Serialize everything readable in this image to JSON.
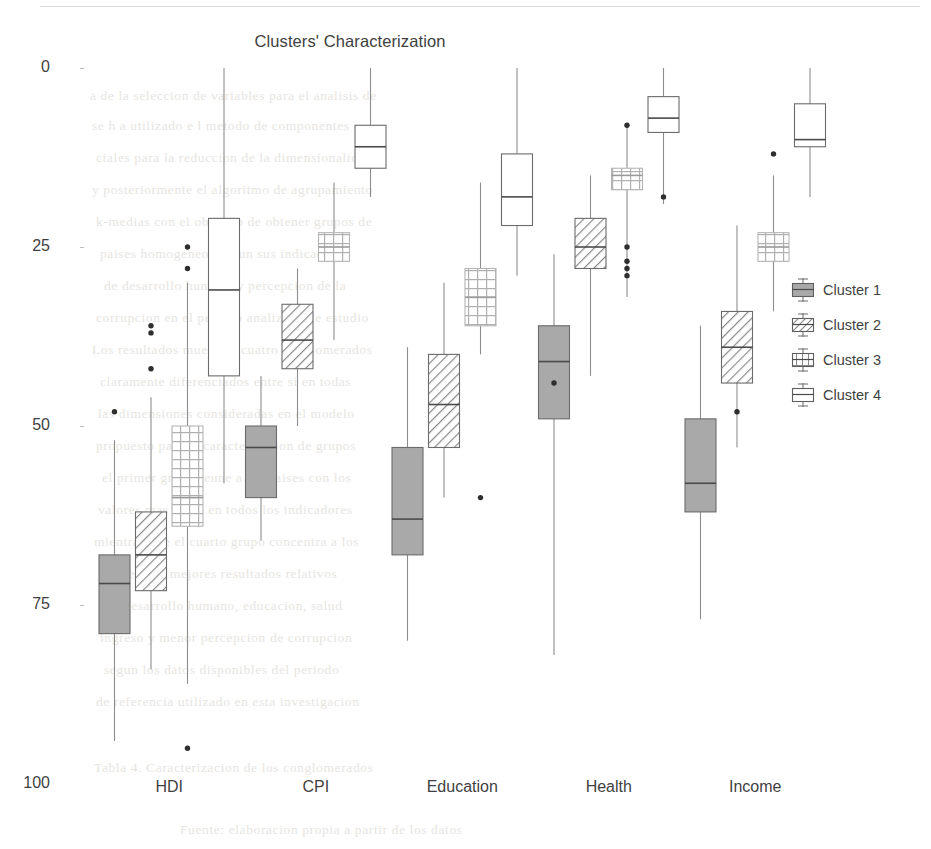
{
  "chart_data": {
    "type": "box",
    "title": "Clusters' Characterization",
    "xlabel": "",
    "ylabel": "",
    "ylim": [
      0,
      100
    ],
    "yticks": [
      0,
      25,
      50,
      75,
      100
    ],
    "grid": false,
    "legend_position": "right",
    "categories": [
      "HDI",
      "CPI",
      "Education",
      "Health",
      "Income"
    ],
    "series": [
      {
        "name": "Cluster 1",
        "fill": "#a6a6a6",
        "pattern": "solid",
        "boxes": [
          {
            "category": "HDI",
            "whisker_low": 6,
            "q1": 21,
            "median": 28,
            "q3": 32,
            "whisker_high": 48,
            "outliers": [
              52
            ]
          },
          {
            "category": "CPI",
            "whisker_low": 34,
            "q1": 40,
            "median": 47,
            "q3": 50,
            "whisker_high": 57,
            "outliers": []
          },
          {
            "category": "Education",
            "whisker_low": 20,
            "q1": 32,
            "median": 37,
            "q3": 47,
            "whisker_high": 61,
            "outliers": []
          },
          {
            "category": "Health",
            "whisker_low": 18,
            "q1": 51,
            "median": 59,
            "q3": 64,
            "whisker_high": 74,
            "outliers": [
              56
            ]
          },
          {
            "category": "Income",
            "whisker_low": 23,
            "q1": 38,
            "median": 42,
            "q3": 51,
            "whisker_high": 64,
            "outliers": []
          }
        ]
      },
      {
        "name": "Cluster 2",
        "fill": "#ffffff",
        "pattern": "diagonal-hatch",
        "boxes": [
          {
            "category": "HDI",
            "whisker_low": 16,
            "q1": 27,
            "median": 32,
            "q3": 38,
            "whisker_high": 54,
            "outliers": [
              58,
              63,
              64
            ]
          },
          {
            "category": "CPI",
            "whisker_low": 50,
            "q1": 58,
            "median": 62,
            "q3": 67,
            "whisker_high": 72,
            "outliers": []
          },
          {
            "category": "Education",
            "whisker_low": 40,
            "q1": 47,
            "median": 53,
            "q3": 60,
            "whisker_high": 70,
            "outliers": []
          },
          {
            "category": "Health",
            "whisker_low": 57,
            "q1": 72,
            "median": 75,
            "q3": 79,
            "whisker_high": 85,
            "outliers": []
          },
          {
            "category": "Income",
            "whisker_low": 47,
            "q1": 56,
            "median": 61,
            "q3": 66,
            "whisker_high": 78,
            "outliers": [
              52
            ]
          }
        ]
      },
      {
        "name": "Cluster 3",
        "fill": "#ffffff",
        "pattern": "cross-hatch",
        "boxes": [
          {
            "category": "HDI",
            "whisker_low": 14,
            "q1": 36,
            "median": 40,
            "q3": 50,
            "whisker_high": 70,
            "outliers": [
              72,
              75,
              5
            ]
          },
          {
            "category": "CPI",
            "whisker_low": 62,
            "q1": 73,
            "median": 75,
            "q3": 77,
            "whisker_high": 84,
            "outliers": []
          },
          {
            "category": "Education",
            "whisker_low": 60,
            "q1": 64,
            "median": 68,
            "q3": 72,
            "whisker_high": 84,
            "outliers": [
              40
            ]
          },
          {
            "category": "Health",
            "whisker_low": 68,
            "q1": 83,
            "median": 85,
            "q3": 86,
            "whisker_high": 92,
            "outliers": [
              75,
              73,
              72,
              71,
              92
            ]
          },
          {
            "category": "Income",
            "whisker_low": 66,
            "q1": 73,
            "median": 75,
            "q3": 77,
            "whisker_high": 85,
            "outliers": [
              88
            ]
          }
        ]
      },
      {
        "name": "Cluster 4",
        "fill": "#ffffff",
        "pattern": "none",
        "boxes": [
          {
            "category": "HDI",
            "whisker_low": 42,
            "q1": 57,
            "median": 69,
            "q3": 79,
            "whisker_high": 100,
            "outliers": []
          },
          {
            "category": "CPI",
            "whisker_low": 82,
            "q1": 86,
            "median": 89,
            "q3": 92,
            "whisker_high": 100,
            "outliers": []
          },
          {
            "category": "Education",
            "whisker_low": 71,
            "q1": 78,
            "median": 82,
            "q3": 88,
            "whisker_high": 100,
            "outliers": []
          },
          {
            "category": "Health",
            "whisker_low": 81,
            "q1": 91,
            "median": 93,
            "q3": 96,
            "whisker_high": 100,
            "outliers": [
              82
            ]
          },
          {
            "category": "Income",
            "whisker_low": 82,
            "q1": 89,
            "median": 90,
            "q3": 95,
            "whisker_high": 100,
            "outliers": []
          }
        ]
      }
    ]
  },
  "axis": {
    "yticks": [
      {
        "label": "100"
      },
      {
        "label": "75"
      },
      {
        "label": "50"
      },
      {
        "label": "25"
      },
      {
        "label": "0"
      }
    ],
    "xticks": [
      {
        "label": "HDI"
      },
      {
        "label": "CPI"
      },
      {
        "label": "Education"
      },
      {
        "label": "Health"
      },
      {
        "label": "Income"
      }
    ]
  },
  "legend": {
    "items": [
      {
        "label": "Cluster 1",
        "pattern": "solid",
        "color": "#a6a6a6"
      },
      {
        "label": "Cluster 2",
        "pattern": "diagonal-hatch",
        "color": "#6e6e6e"
      },
      {
        "label": "Cluster 3",
        "pattern": "cross-hatch",
        "color": "#6e6e6e"
      },
      {
        "label": "Cluster 4",
        "pattern": "none",
        "color": "#6e6e6e"
      }
    ]
  },
  "background_artifacts": [
    {
      "text": "a de la seleccion de variables para el analisis de",
      "x": 90,
      "y": 88
    },
    {
      "text": "se h a utilizado e l metodo de componentes",
      "x": 92,
      "y": 118
    },
    {
      "text": "ciales para la reduccion de la dimensionalidad",
      "x": 96,
      "y": 150
    },
    {
      "text": "y posteriormente el algoritmo de agrupamiento",
      "x": 92,
      "y": 182
    },
    {
      "text": "k-medias con el objetivo de obtener grupos de",
      "x": 96,
      "y": 214
    },
    {
      "text": "paises homogeneos segun sus indicadores",
      "x": 100,
      "y": 246
    },
    {
      "text": "de desarrollo humano y percepcion de la",
      "x": 104,
      "y": 278
    },
    {
      "text": "corrupcion en el periodo analizado de estudio",
      "x": 96,
      "y": 310
    },
    {
      "text": "Los resultados muestran cuatro conglomerados",
      "x": 92,
      "y": 342
    },
    {
      "text": "claramente diferenciados entre si en todas",
      "x": 100,
      "y": 374
    },
    {
      "text": "las dimensiones consideradas en el modelo",
      "x": 98,
      "y": 406
    },
    {
      "text": "propuesto para la caracterizacion de grupos",
      "x": 96,
      "y": 438
    },
    {
      "text": "el primer grupo reune a los paises con los",
      "x": 102,
      "y": 470
    },
    {
      "text": "valores mas bajos en todos los indicadores",
      "x": 98,
      "y": 502
    },
    {
      "text": "mientras que el cuarto grupo concentra a los",
      "x": 94,
      "y": 534
    },
    {
      "text": "paises con mejores resultados relativos",
      "x": 104,
      "y": 566
    },
    {
      "text": "en desarrollo humano, educacion, salud",
      "x": 106,
      "y": 598
    },
    {
      "text": "ingreso y menor percepcion de corrupcion",
      "x": 100,
      "y": 630
    },
    {
      "text": "segun los datos disponibles del periodo",
      "x": 104,
      "y": 662
    },
    {
      "text": "de referencia utilizado en esta investigacion",
      "x": 96,
      "y": 694
    },
    {
      "text": "Tabla 4. Caracterizacion de los conglomerados",
      "x": 94,
      "y": 760
    },
    {
      "text": "Fuente: elaboracion propia a partir de los datos",
      "x": 180,
      "y": 822
    }
  ]
}
